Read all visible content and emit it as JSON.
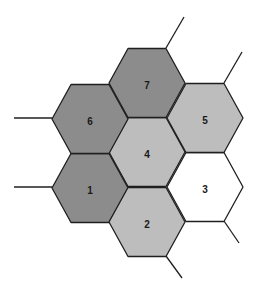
{
  "diagram": {
    "type": "hexagonal-cluster",
    "stroke_color": "#1f1f1f",
    "hex_half_width": 38,
    "hex_half_height": 34.5,
    "hexagons": [
      {
        "id": "1",
        "label": "1",
        "cx": 90,
        "cy": 188,
        "fill": "#8c8c8c"
      },
      {
        "id": "2",
        "label": "2",
        "cx": 147,
        "cy": 222,
        "fill": "#bdbdbd"
      },
      {
        "id": "3",
        "label": "3",
        "cx": 205,
        "cy": 187,
        "fill": "#ffffff"
      },
      {
        "id": "4",
        "label": "4",
        "cx": 147,
        "cy": 152,
        "fill": "#bdbdbd"
      },
      {
        "id": "5",
        "label": "5",
        "cx": 205,
        "cy": 118,
        "fill": "#bdbdbd"
      },
      {
        "id": "6",
        "label": "6",
        "cx": 90,
        "cy": 119,
        "fill": "#8c8c8c"
      },
      {
        "id": "7",
        "label": "7",
        "cx": 147,
        "cy": 83,
        "fill": "#8c8c8c"
      }
    ],
    "connectors": [
      {
        "from_hex": "6",
        "x1": 14,
        "y1": 118,
        "x2": 52,
        "y2": 118
      },
      {
        "from_hex": "1",
        "x1": 14,
        "y1": 187,
        "x2": 52,
        "y2": 187
      },
      {
        "from_hex": "7",
        "x1": 166,
        "y1": 48,
        "x2": 184,
        "y2": 17
      },
      {
        "from_hex": "5",
        "x1": 224,
        "y1": 83,
        "x2": 242,
        "y2": 52
      },
      {
        "from_hex": "3",
        "x1": 224,
        "y1": 221,
        "x2": 239,
        "y2": 243
      },
      {
        "from_hex": "2",
        "x1": 166,
        "y1": 256,
        "x2": 182,
        "y2": 278
      }
    ]
  }
}
